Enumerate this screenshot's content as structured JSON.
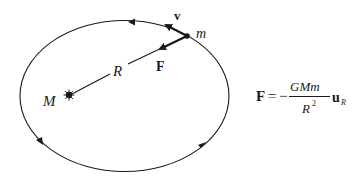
{
  "diagram": {
    "labels": {
      "central_mass": "M",
      "orbiting_mass": "m",
      "radius": "R",
      "velocity": "v",
      "force": "F"
    },
    "formula": {
      "lhs": "F",
      "equals": "=",
      "sign": "−",
      "numerator": "GMm",
      "denominator_base": "R",
      "denominator_exp": "2",
      "unit_vector": "u",
      "unit_vector_sub": "R"
    },
    "colors": {
      "ink": "#1a1a1a",
      "background": "#ffffff"
    }
  }
}
